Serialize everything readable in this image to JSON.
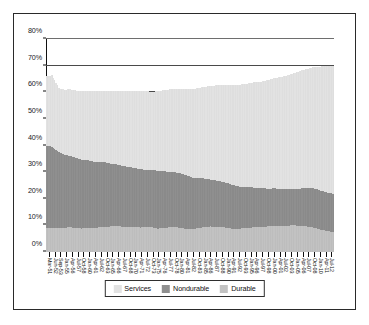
{
  "chart_data": {
    "type": "bar",
    "title": "",
    "subtitle": "",
    "xlabel": "",
    "ylabel": "",
    "stacked": true,
    "grid": true,
    "legend_position": "bottom",
    "ylim": [
      0,
      80
    ],
    "ytick_labels": [
      "0%",
      "10%",
      "20%",
      "30%",
      "40%",
      "50%",
      "60%",
      "70%",
      "80%"
    ],
    "ytick_values": [
      0,
      10,
      20,
      30,
      40,
      50,
      60,
      70,
      80
    ],
    "series_order": [
      "Durable",
      "Nondurable",
      "Services"
    ],
    "legend_entries": [
      {
        "name": "Services",
        "color": "#e2e2e2"
      },
      {
        "name": "Nondurable",
        "color": "#8f8f8f"
      },
      {
        "name": "Durable",
        "color": "#c2c2c2"
      }
    ],
    "categories": [
      "Mar-51",
      "Jun-52",
      "Sep-53",
      "Jan-55",
      "Apr-56",
      "Jul-57",
      "Oct-58",
      "Jan-60",
      "Apr-61",
      "Jul-62",
      "Oct-63",
      "Jan-65",
      "Apr-66",
      "Jul-67",
      "Oct-68",
      "Jan-70",
      "Apr-71",
      "Jul-72",
      "Oct-73",
      "Jan-75",
      "Apr-76",
      "Jul-77",
      "Oct-78",
      "Jan-80",
      "Apr-81",
      "Jul-82",
      "Oct-83",
      "Jan-85",
      "Apr-86",
      "Jul-87",
      "Oct-88",
      "Jan-90",
      "Apr-91",
      "Jul-92",
      "Oct-93",
      "Jan-95",
      "Apr-96",
      "Jul-97",
      "Oct-98",
      "Jan-00",
      "Apr-01",
      "Jul-02",
      "Oct-03",
      "Jan-05",
      "Apr-06",
      "Jul-07",
      "Oct-08",
      "Jan-10",
      "Apr-11",
      "Jul-12"
    ],
    "x_tick_count": 50,
    "series": [
      {
        "name": "Durable",
        "color": "#c2c2c2",
        "values": [
          9.0,
          9.2,
          8.9,
          9.1,
          9.3,
          9.0,
          8.8,
          9.2,
          9.0,
          9.3,
          9.5,
          9.6,
          9.8,
          9.5,
          9.4,
          9.3,
          9.2,
          9.4,
          9.3,
          8.8,
          9.0,
          9.3,
          9.5,
          9.0,
          8.7,
          8.6,
          9.0,
          9.4,
          9.6,
          9.5,
          9.4,
          9.0,
          8.7,
          8.8,
          9.0,
          9.2,
          9.3,
          9.4,
          9.7,
          9.9,
          9.8,
          9.9,
          10.0,
          9.9,
          9.7,
          9.5,
          8.9,
          8.3,
          7.8,
          7.4
        ]
      },
      {
        "name": "Nondurable",
        "color": "#8f8f8f",
        "values": [
          31.0,
          30.2,
          28.8,
          27.5,
          26.8,
          26.4,
          25.8,
          25.4,
          24.9,
          24.6,
          24.2,
          23.6,
          23.2,
          22.8,
          22.5,
          22.3,
          21.9,
          21.5,
          21.6,
          21.7,
          21.3,
          20.8,
          20.4,
          20.4,
          20.0,
          19.3,
          18.7,
          18.2,
          17.6,
          17.3,
          17.0,
          16.8,
          16.3,
          15.8,
          15.4,
          15.1,
          14.8,
          14.5,
          14.1,
          14.0,
          13.8,
          13.6,
          13.7,
          13.9,
          14.2,
          14.6,
          14.8,
          14.6,
          14.5,
          14.4
        ]
      },
      {
        "name": "Services",
        "color": "#e2e2e2",
        "values": [
          26.0,
          27.0,
          24.0,
          24.4,
          25.0,
          25.3,
          25.8,
          25.9,
          26.4,
          26.6,
          26.9,
          27.4,
          27.6,
          28.1,
          28.6,
          28.9,
          29.4,
          29.5,
          29.3,
          29.9,
          30.5,
          31.0,
          31.4,
          31.9,
          32.6,
          33.4,
          33.9,
          34.5,
          35.2,
          35.8,
          36.3,
          37.0,
          37.8,
          38.3,
          38.8,
          39.3,
          39.8,
          40.2,
          40.9,
          41.4,
          42.2,
          42.8,
          43.3,
          44.0,
          44.6,
          45.1,
          45.8,
          46.8,
          47.5,
          48.0
        ]
      }
    ]
  }
}
